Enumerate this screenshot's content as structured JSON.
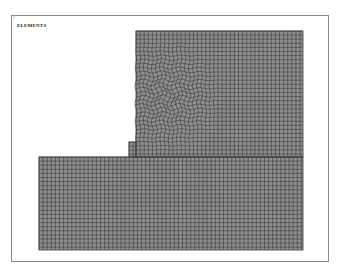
{
  "viewport": {
    "window_number": "1",
    "label": "ELEMENTS"
  },
  "mesh": {
    "description": "Finite element mesh, L-shaped domain with refined irregular region",
    "fill_color": "#8e8e8e",
    "line_color": "#3a3a3a"
  }
}
